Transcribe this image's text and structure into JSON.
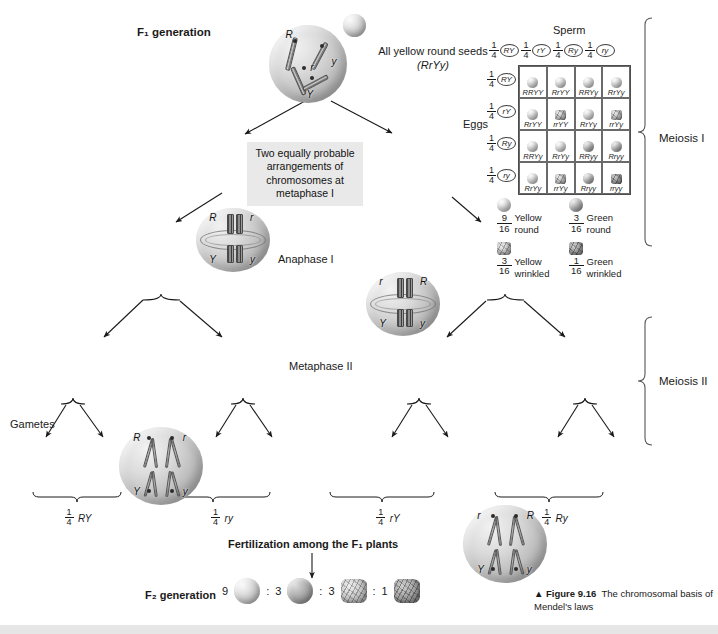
{
  "figure": {
    "caption_marker": "▲",
    "caption_label": "Figure 9.16",
    "caption_text": "The chromosomal basis of Mendel's laws"
  },
  "labels": {
    "f1_generation": "F₁ generation",
    "all_yellow_round": "All yellow round seeds",
    "all_yellow_round_genotype": "(RrYy)",
    "note_box": "Two equally probable arrangements of chromosomes at metaphase I",
    "anaphase_i": "Anaphase I",
    "metaphase_ii": "Metaphase II",
    "gametes": "Gametes",
    "meiosis_i": "Meiosis I",
    "meiosis_ii": "Meiosis II",
    "fertilization": "Fertilization among the F₁ plants",
    "f2_generation": "F₂ generation"
  },
  "parent_cell": {
    "alleles": [
      "R",
      "r",
      "y",
      "Y"
    ]
  },
  "metaphase_i_cells": [
    {
      "top_left": "R",
      "top_right": "r",
      "bottom_left": "Y",
      "bottom_right": "y"
    },
    {
      "top_left": "r",
      "top_right": "R",
      "bottom_left": "Y",
      "bottom_right": "y"
    }
  ],
  "anaphase_i_cells": [
    {
      "top_left": "R",
      "top_right": "r",
      "bottom_left": "Y",
      "bottom_right": "y"
    },
    {
      "top_left": "r",
      "top_right": "R",
      "bottom_left": "Y",
      "bottom_right": "y"
    }
  ],
  "metaphase_ii_cells": [
    {
      "top": "R",
      "bottom": "Y",
      "top_side": "left",
      "bottom_side": "left"
    },
    {
      "top": "r",
      "bottom": "y",
      "top_side": "right",
      "bottom_side": "right"
    },
    {
      "top": "r",
      "bottom": "Y",
      "top_side": "left",
      "bottom_side": "left"
    },
    {
      "top": "R",
      "bottom": "y",
      "top_side": "right",
      "bottom_side": "right"
    }
  ],
  "gametes": [
    {
      "a": "Y",
      "b": "R"
    },
    {
      "a": "Y",
      "b": "R"
    },
    {
      "a": "y",
      "b": "r"
    },
    {
      "a": "y",
      "b": "r"
    },
    {
      "a": "Y",
      "b": "r"
    },
    {
      "a": "Y",
      "b": "r"
    },
    {
      "a": "y",
      "b": "R"
    },
    {
      "a": "y",
      "b": "R"
    }
  ],
  "gamete_brackets": [
    {
      "num": "1",
      "den": "4",
      "genotype": "RY"
    },
    {
      "num": "1",
      "den": "4",
      "genotype": "ry"
    },
    {
      "num": "1",
      "den": "4",
      "genotype": "rY"
    },
    {
      "num": "1",
      "den": "4",
      "genotype": "Ry"
    }
  ],
  "punnett": {
    "title_sperm": "Sperm",
    "title_eggs": "Eggs",
    "sperm_headers": [
      {
        "num": "1",
        "den": "4",
        "allele": "RY"
      },
      {
        "num": "1",
        "den": "4",
        "allele": "rY"
      },
      {
        "num": "1",
        "den": "4",
        "allele": "Ry"
      },
      {
        "num": "1",
        "den": "4",
        "allele": "ry"
      }
    ],
    "egg_headers": [
      {
        "num": "1",
        "den": "4",
        "allele": "RY"
      },
      {
        "num": "1",
        "den": "4",
        "allele": "rY"
      },
      {
        "num": "1",
        "den": "4",
        "allele": "Ry"
      },
      {
        "num": "1",
        "den": "4",
        "allele": "ry"
      }
    ],
    "cells": [
      {
        "genotype": "RRYY",
        "phenotype": "yellow-round"
      },
      {
        "genotype": "RrYY",
        "phenotype": "yellow-round"
      },
      {
        "genotype": "RRYy",
        "phenotype": "yellow-round"
      },
      {
        "genotype": "RrYy",
        "phenotype": "yellow-round"
      },
      {
        "genotype": "RrYY",
        "phenotype": "yellow-round"
      },
      {
        "genotype": "rrYY",
        "phenotype": "yellow-wrinkled"
      },
      {
        "genotype": "RrYy",
        "phenotype": "yellow-round"
      },
      {
        "genotype": "rrYy",
        "phenotype": "yellow-wrinkled"
      },
      {
        "genotype": "RRYy",
        "phenotype": "yellow-round"
      },
      {
        "genotype": "RrYy",
        "phenotype": "yellow-round"
      },
      {
        "genotype": "RRyy",
        "phenotype": "green-round"
      },
      {
        "genotype": "Rryy",
        "phenotype": "green-round"
      },
      {
        "genotype": "RrYy",
        "phenotype": "yellow-round"
      },
      {
        "genotype": "rrYy",
        "phenotype": "yellow-wrinkled"
      },
      {
        "genotype": "Rryy",
        "phenotype": "green-round"
      },
      {
        "genotype": "rryy",
        "phenotype": "green-wrinkled"
      }
    ],
    "legend": [
      {
        "num": "9",
        "den": "16",
        "line1": "Yellow",
        "line2": "round",
        "phenotype": "yellow-round"
      },
      {
        "num": "3",
        "den": "16",
        "line1": "Green",
        "line2": "round",
        "phenotype": "green-round"
      },
      {
        "num": "3",
        "den": "16",
        "line1": "Yellow",
        "line2": "wrinkled",
        "phenotype": "yellow-wrinkled"
      },
      {
        "num": "1",
        "den": "16",
        "line1": "Green",
        "line2": "wrinkled",
        "phenotype": "green-wrinkled"
      }
    ]
  },
  "f2_ratio": {
    "items": [
      {
        "count": "9",
        "phenotype": "yellow-round"
      },
      {
        "count": "3",
        "phenotype": "green-round"
      },
      {
        "count": "3",
        "phenotype": "yellow-wrinkled"
      },
      {
        "count": "1",
        "phenotype": "green-wrinkled"
      }
    ],
    "separator": ":"
  }
}
